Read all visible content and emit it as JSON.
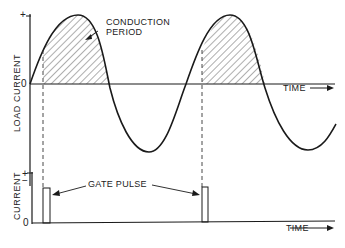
{
  "upper_plot": {
    "y_axis_label": "LOAD CURRENT",
    "y_plus": "+",
    "y_zero": "0",
    "y_minus": "−",
    "x_axis_label": "TIME",
    "annotation": [
      "CONDUCTION",
      "PERIOD"
    ]
  },
  "lower_plot": {
    "y_axis_label": "CURRENT",
    "y_plus": "+",
    "y_zero": "0",
    "x_axis_label": "TIME",
    "annotation": "GATE PULSE"
  },
  "colors": {
    "line": "#1a1a1a",
    "background": "#ffffff"
  }
}
